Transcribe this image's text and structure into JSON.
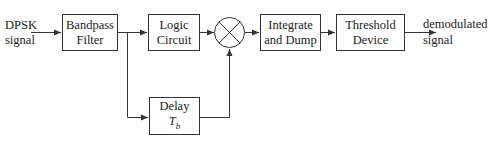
{
  "diagram": {
    "type": "block-diagram",
    "input_label": {
      "line1": "DPSK",
      "line2": "signal"
    },
    "output_label": {
      "line1": "demodulated",
      "line2": "signal"
    },
    "blocks": {
      "bandpass_filter": {
        "line1": "Bandpass",
        "line2": "Filter"
      },
      "logic_circuit": {
        "line1": "Logic",
        "line2": "Circuit"
      },
      "multiplier": {
        "symbol": "multiplier-x"
      },
      "integrate_dump": {
        "line1": "Integrate",
        "line2": "and Dump"
      },
      "threshold_device": {
        "line1": "Threshold",
        "line2": "Device"
      },
      "delay": {
        "line1": "Delay",
        "line2_base": "T",
        "line2_sub": "b"
      }
    },
    "connections": [
      {
        "from": "input",
        "to": "bandpass_filter"
      },
      {
        "from": "bandpass_filter",
        "to": "logic_circuit"
      },
      {
        "from": "bandpass_filter",
        "to": "delay"
      },
      {
        "from": "logic_circuit",
        "to": "multiplier"
      },
      {
        "from": "delay",
        "to": "multiplier"
      },
      {
        "from": "multiplier",
        "to": "integrate_dump"
      },
      {
        "from": "integrate_dump",
        "to": "threshold_device"
      },
      {
        "from": "threshold_device",
        "to": "output"
      }
    ],
    "colors": {
      "line": "#333333",
      "text": "#222222",
      "background": "#ffffff"
    }
  }
}
